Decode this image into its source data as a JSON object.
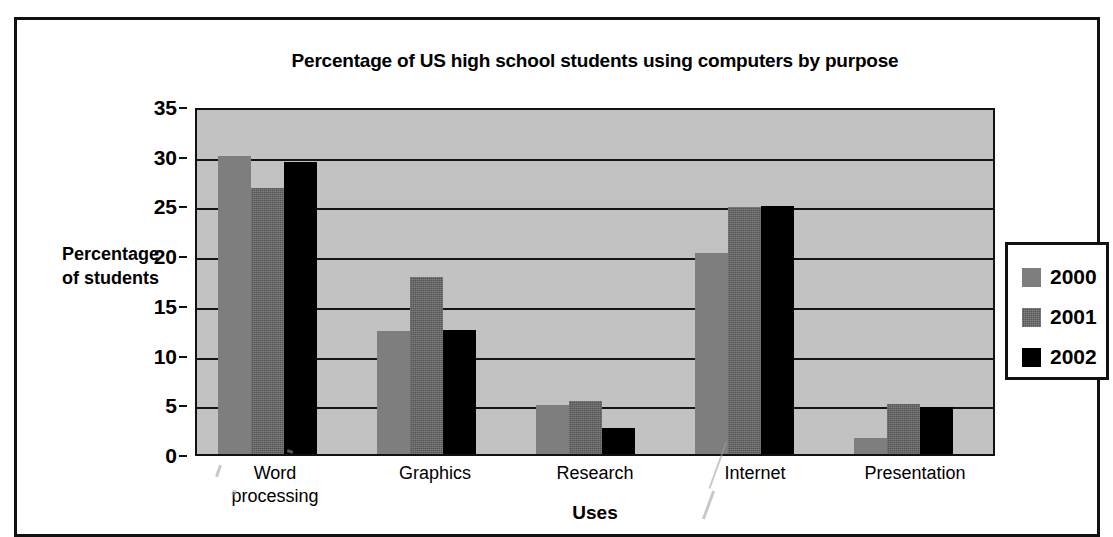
{
  "chart_data": {
    "type": "bar",
    "title": "Percentage of US high school students using computers by purpose",
    "xlabel": "Uses",
    "ylabel": "Percentage of students",
    "ylabel_lines": [
      "Percentage",
      "of students"
    ],
    "categories": [
      "Word processing",
      "Graphics",
      "Research",
      "Internet",
      "Presentation"
    ],
    "category_lines": [
      [
        "Word",
        "processing"
      ],
      [
        "Graphics"
      ],
      [
        "Research"
      ],
      [
        "Internet"
      ],
      [
        "Presentation"
      ]
    ],
    "series": [
      {
        "name": "2000",
        "color": "#7e7e7e",
        "values": [
          30.0,
          12.4,
          4.9,
          20.2,
          1.6
        ]
      },
      {
        "name": "2001",
        "color": "#555555",
        "values": [
          26.8,
          17.8,
          5.3,
          24.8,
          5.0
        ]
      },
      {
        "name": "2002",
        "color": "#000000",
        "values": [
          29.4,
          12.5,
          2.6,
          24.9,
          4.7
        ]
      }
    ],
    "ylim": [
      0,
      35
    ],
    "yticks": [
      0,
      5,
      10,
      15,
      20,
      25,
      30,
      35
    ],
    "ytick_labels": [
      "0",
      "5",
      "10",
      "15",
      "20",
      "25",
      "30",
      "35"
    ],
    "grid": true,
    "legend_position": "right",
    "plot_background": "#c2c2c2",
    "page_background": "#ffffff"
  }
}
